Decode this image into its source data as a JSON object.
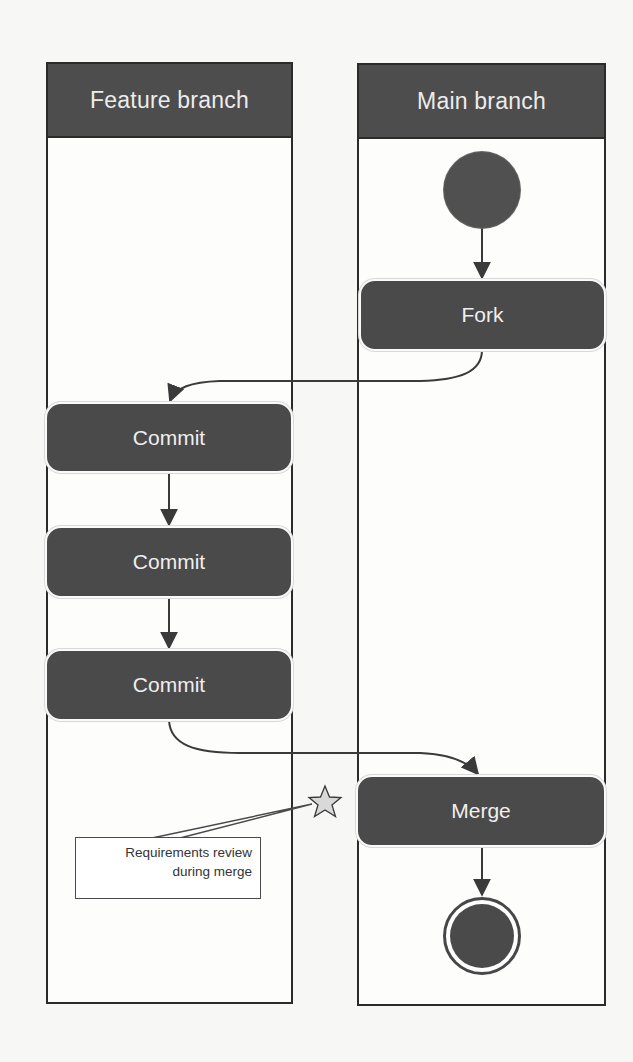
{
  "diagram": {
    "type": "uml-activity-swimlane",
    "lanes": [
      {
        "id": "feature",
        "label": "Feature branch"
      },
      {
        "id": "main",
        "label": "Main branch"
      }
    ],
    "nodes": {
      "start": {
        "kind": "initial",
        "lane": "main"
      },
      "fork": {
        "kind": "action",
        "lane": "main",
        "label": "Fork"
      },
      "commit1": {
        "kind": "action",
        "lane": "feature",
        "label": "Commit"
      },
      "commit2": {
        "kind": "action",
        "lane": "feature",
        "label": "Commit"
      },
      "commit3": {
        "kind": "action",
        "lane": "feature",
        "label": "Commit"
      },
      "merge": {
        "kind": "action",
        "lane": "main",
        "label": "Merge"
      },
      "end": {
        "kind": "final",
        "lane": "main"
      }
    },
    "edges": [
      {
        "from": "start",
        "to": "fork"
      },
      {
        "from": "fork",
        "to": "commit1"
      },
      {
        "from": "commit1",
        "to": "commit2"
      },
      {
        "from": "commit2",
        "to": "commit3"
      },
      {
        "from": "commit3",
        "to": "merge"
      },
      {
        "from": "merge",
        "to": "end"
      }
    ],
    "annotation": {
      "icon": "star-icon",
      "line1": "Requirements review",
      "line2": "during merge",
      "attached_to": "merge"
    },
    "colors": {
      "lane_header": "#4d4d4d",
      "node_fill": "#4a4a4a",
      "node_text": "#efefef",
      "edge": "#3a3a3a",
      "star_fill": "#d9d9d9"
    }
  }
}
